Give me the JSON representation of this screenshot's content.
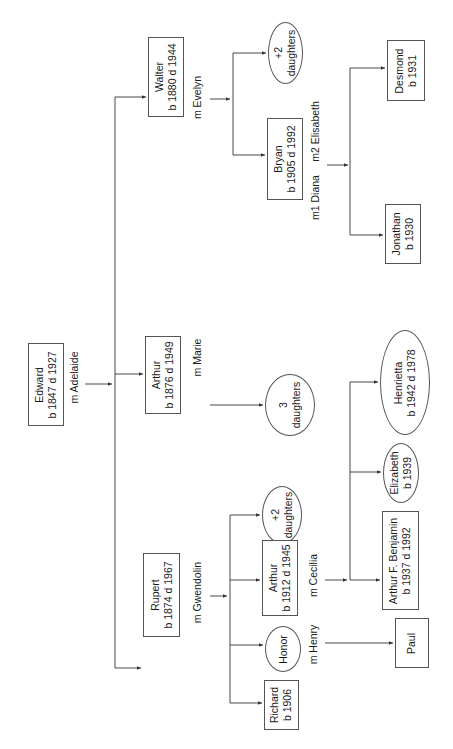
{
  "diagram": {
    "type": "family-tree",
    "orientation": "rotated-90-ccw",
    "root": {
      "id": "edward",
      "name": "Edward",
      "dates": "b 1847 d 1927",
      "shape": "box",
      "spouse_label": "m Adelaide"
    },
    "generation2": [
      {
        "id": "walter",
        "name": "Walter",
        "dates": "b 1880 d 1944",
        "shape": "box",
        "spouse_label": "m Evelyn"
      },
      {
        "id": "arthur1876",
        "name": "Arthur",
        "dates": "b 1876 d 1949",
        "shape": "box",
        "spouse_label": "m Marie"
      },
      {
        "id": "rupert",
        "name": "Rupert",
        "dates": "b 1874 d 1967",
        "shape": "box",
        "spouse_label": "m Gwendolin"
      }
    ],
    "generation3": [
      {
        "id": "walter-daughters",
        "name": "+2",
        "dates": "daughters",
        "shape": "ellipse",
        "parent": "walter"
      },
      {
        "id": "bryan",
        "name": "Bryan",
        "dates": "b 1905 d 1992",
        "shape": "box",
        "parent": "walter",
        "spouse_labels": [
          "m1 Diana",
          "m2 Elisabeth"
        ]
      },
      {
        "id": "arthur-daughters",
        "name": "3",
        "dates": "daughters",
        "shape": "ellipse",
        "parent": "arthur1876"
      },
      {
        "id": "rupert-daughters",
        "name": "+2",
        "dates": "daughters",
        "shape": "ellipse",
        "parent": "rupert"
      },
      {
        "id": "arthur1912",
        "name": "Arthur",
        "dates": "b 1912 d 1945",
        "shape": "box",
        "parent": "rupert",
        "spouse_label": "m Cecilia"
      },
      {
        "id": "honor",
        "name": "Honor",
        "dates": "",
        "shape": "ellipse",
        "parent": "rupert",
        "spouse_label": "m Henry"
      },
      {
        "id": "richard",
        "name": "Richard",
        "dates": "b 1906",
        "shape": "box",
        "parent": "rupert"
      }
    ],
    "generation4": [
      {
        "id": "desmond",
        "name": "Desmond",
        "dates": "b 1931",
        "shape": "box",
        "parent": "bryan"
      },
      {
        "id": "jonathan",
        "name": "Jonathan",
        "dates": "b 1930",
        "shape": "box",
        "parent": "bryan"
      },
      {
        "id": "henrietta",
        "name": "Henrietta",
        "dates": "b 1942 d 1978",
        "shape": "ellipse",
        "parent": "arthur1912"
      },
      {
        "id": "elizabeth",
        "name": "Elizabeth",
        "dates": "b 1939",
        "shape": "ellipse",
        "parent": "arthur1912"
      },
      {
        "id": "arthur-f-benjamin",
        "name": "Arthur F. Benjamin",
        "dates": "b 1937 d 1992",
        "shape": "box",
        "parent": "arthur1912"
      },
      {
        "id": "paul",
        "name": "Paul",
        "dates": "",
        "shape": "box",
        "parent": "honor"
      }
    ]
  },
  "labels": {
    "m_adelaide": "m Adelaide",
    "m_evelyn": "m Evelyn",
    "m_marie": "m Marie",
    "m_gwendolin": "m Gwendolin",
    "m_henry": "m Henry",
    "m_cecilia": "m Cecilia",
    "m1_diana": "m1 Diana",
    "m2_elisabeth": "m2 Elisabeth"
  },
  "nodes": {
    "edward": {
      "name": "Edward",
      "dates": "b 1847 d 1927"
    },
    "walter": {
      "name": "Walter",
      "dates": "b 1880 d 1944"
    },
    "arthur1876": {
      "name": "Arthur",
      "dates": "b 1876 d 1949"
    },
    "rupert": {
      "name": "Rupert",
      "dates": "b 1874 d 1967"
    },
    "walter_daughters": {
      "name": "+2",
      "dates": "daughters"
    },
    "bryan": {
      "name": "Bryan",
      "dates": "b 1905 d 1992"
    },
    "arthur_daughters": {
      "name": "3",
      "dates": "daughters"
    },
    "rupert_daughters": {
      "name": "+2",
      "dates": "daughters"
    },
    "arthur1912": {
      "name": "Arthur",
      "dates": "b 1912 d 1945"
    },
    "honor": {
      "name": "Honor"
    },
    "richard": {
      "name": "Richard",
      "dates": "b 1906"
    },
    "desmond": {
      "name": "Desmond",
      "dates": "b 1931"
    },
    "jonathan": {
      "name": "Jonathan",
      "dates": "b 1930"
    },
    "henrietta": {
      "name": "Henrietta",
      "dates": "b 1942 d 1978"
    },
    "elizabeth": {
      "name": "Elizabeth",
      "dates": "b 1939"
    },
    "arthur_f_benjamin": {
      "name": "Arthur F. Benjamin",
      "dates": "b 1937 d 1992"
    },
    "paul": {
      "name": "Paul"
    }
  },
  "colors": {
    "line": "#333333",
    "border": "#555555",
    "text": "#1a1a1a",
    "background": "#ffffff"
  }
}
